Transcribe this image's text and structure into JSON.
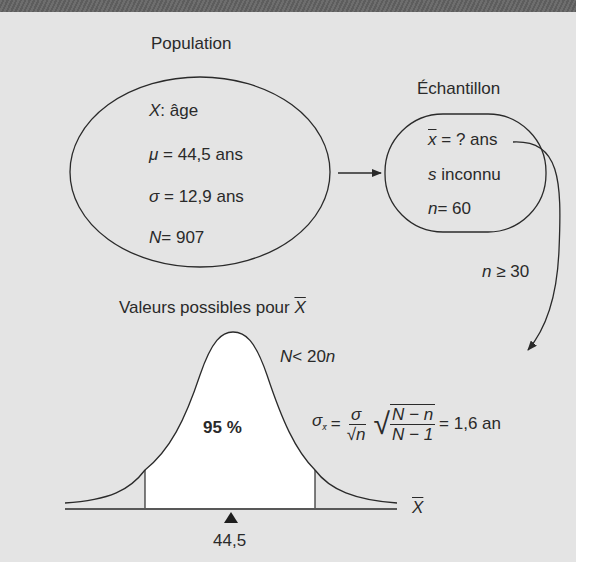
{
  "population": {
    "title": "Population",
    "variable_symbol": "X",
    "variable_sep": ":",
    "variable_label": "âge",
    "mu_symbol": "μ",
    "mu_value": "= 44,5 ans",
    "sigma_symbol": "σ",
    "sigma_value": "= 12,9 ans",
    "N_symbol": "N",
    "N_value": "=  907"
  },
  "sample": {
    "title": "Échantillon",
    "xbar_symbol": "x",
    "xbar_value": "= ? ans",
    "s_symbol": "s",
    "s_value": "inconnu",
    "n_symbol": "n",
    "n_value": "= 60"
  },
  "condition_sample": {
    "n_symbol": "n",
    "text": "≥ 30"
  },
  "distribution": {
    "title": "Valeurs possibles pour",
    "title_symbol": "X",
    "condition_N": "N",
    "condition_rest": "< 20",
    "condition_n": "n",
    "center_pct": "95 %",
    "axis_label": "X",
    "mean_marker": "44,5"
  },
  "formula": {
    "lhs_symbol": "σ",
    "lhs_sub": "x̄",
    "eq": "=",
    "frac1_num": "σ",
    "frac1_den_root": "√",
    "frac1_den_var": "n",
    "sqrt_num": "N − n",
    "sqrt_den": "N − 1",
    "result": "= 1,6 an"
  },
  "colors": {
    "panel_bg": "#e4e4e4",
    "top_band": "#656565",
    "ink": "#2a2a2a",
    "area_fill": "#ffffff"
  }
}
